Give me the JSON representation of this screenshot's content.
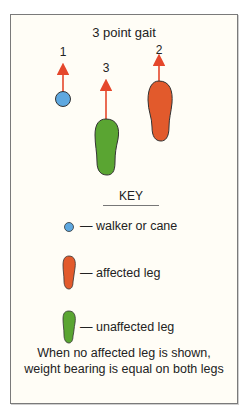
{
  "diagram": {
    "title": "3 point gait",
    "steps": [
      {
        "order": "1",
        "item": "walker or cane"
      },
      {
        "order": "2",
        "item": "affected leg"
      },
      {
        "order": "3",
        "item": "unaffected leg"
      }
    ],
    "colors": {
      "walker": "#5ea8e0",
      "affected": "#e25a2c",
      "unaffected": "#5aa532",
      "arrow": "#e5472b",
      "outline": "#333333"
    }
  },
  "key": {
    "title": "KEY",
    "items": [
      {
        "icon": "circle",
        "label": "— walker or cane"
      },
      {
        "icon": "orange-footprint",
        "label": "— affected leg"
      },
      {
        "icon": "green-footprint",
        "label": "— unaffected leg"
      }
    ]
  },
  "note": {
    "line1": "When no affected leg is shown,",
    "line2": "weight bearing is equal on both legs"
  }
}
